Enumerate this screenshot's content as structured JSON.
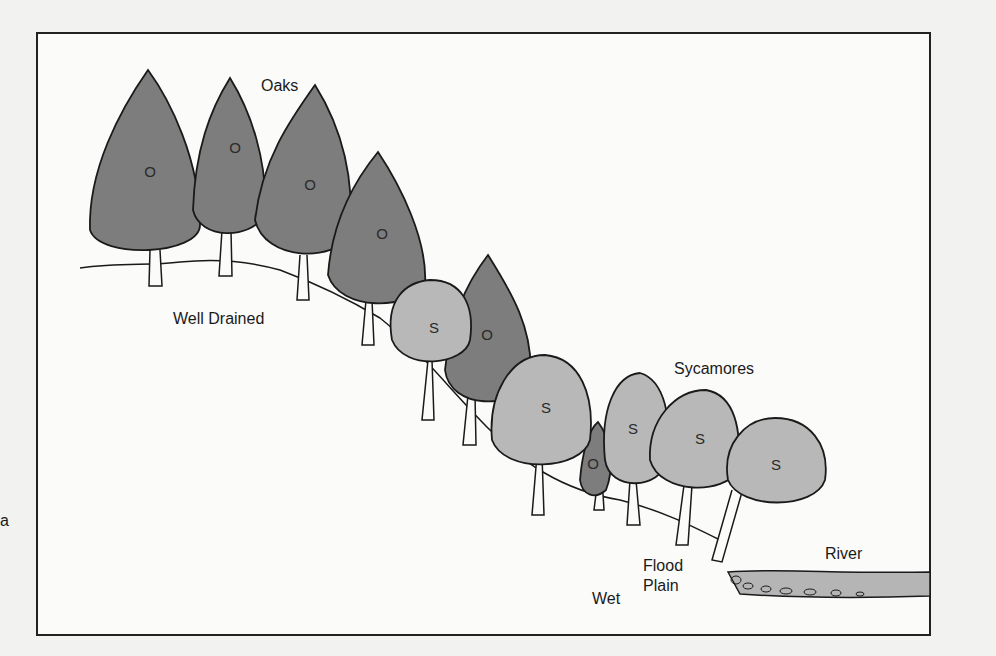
{
  "diagram": {
    "type": "landscape cross-section",
    "colors": {
      "oak_fill": "#7d7d7d",
      "sycamore_fill": "#b8b8b8",
      "river_fill": "#b5b5b5",
      "outline": "#1a1a1a",
      "background": "#fbfbfa"
    },
    "labels": {
      "oaks": "Oaks",
      "well_drained": "Well Drained",
      "sycamores": "Sycamores",
      "wet": "Wet",
      "flood_plain_line1": "Flood",
      "flood_plain_line2": "Plain",
      "river": "River",
      "edge_fragment": "a"
    },
    "trees": [
      {
        "species": "oak",
        "marker": "O"
      },
      {
        "species": "oak",
        "marker": "O"
      },
      {
        "species": "oak",
        "marker": "O"
      },
      {
        "species": "oak",
        "marker": "O"
      },
      {
        "species": "sycamore",
        "marker": "S"
      },
      {
        "species": "oak",
        "marker": "O"
      },
      {
        "species": "sycamore",
        "marker": "S"
      },
      {
        "species": "oak",
        "marker": "O"
      },
      {
        "species": "sycamore",
        "marker": "S"
      },
      {
        "species": "sycamore",
        "marker": "S"
      },
      {
        "species": "sycamore",
        "marker": "S"
      }
    ]
  }
}
